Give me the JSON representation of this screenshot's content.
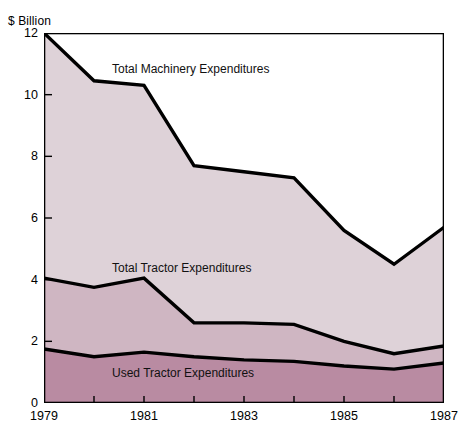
{
  "chart_data": {
    "type": "area",
    "title": "",
    "subtitle": "",
    "xlabel": "",
    "ylabel": "$ Billion",
    "unit_label": "$ Billion",
    "x": [
      1979,
      1980,
      1981,
      1982,
      1983,
      1984,
      1985,
      1986,
      1987
    ],
    "xtick_labels": [
      "1979",
      "1981",
      "1983",
      "1985",
      "1987"
    ],
    "xtick_values": [
      1979,
      1981,
      1983,
      1985,
      1987
    ],
    "xlim": [
      1979,
      1987
    ],
    "ytick_labels": [
      "0",
      "2",
      "4",
      "6",
      "8",
      "10",
      "12"
    ],
    "ytick_values": [
      0,
      2,
      4,
      6,
      8,
      10,
      12
    ],
    "ylim": [
      0,
      12
    ],
    "grid": false,
    "legend_position": "inline-annotations",
    "stacked": false,
    "series": [
      {
        "name": "Total Machinery Expenditures",
        "label": "Total Machinery Expenditures",
        "fill_color": "#ded2d8",
        "line_color": "#000000",
        "values": [
          12.0,
          10.45,
          10.3,
          7.7,
          7.5,
          7.3,
          5.6,
          4.5,
          5.7
        ]
      },
      {
        "name": "Total Tractor Expenditures",
        "label": "Total Tractor Expenditures",
        "fill_color": "#cfb6c2",
        "line_color": "#000000",
        "values": [
          4.05,
          3.75,
          4.05,
          2.6,
          2.6,
          2.55,
          2.0,
          1.6,
          1.85
        ]
      },
      {
        "name": "Used Tractor Expenditures",
        "label": "Used Tractor Expenditures",
        "fill_color": "#b98ba2",
        "line_color": "#000000",
        "values": [
          1.75,
          1.5,
          1.65,
          1.5,
          1.4,
          1.35,
          1.2,
          1.1,
          1.3
        ]
      }
    ],
    "annotations": [
      {
        "text": "Total Machinery Expenditures",
        "x_px": 112,
        "y_px": 62
      },
      {
        "text": "Total Tractor Expenditures",
        "x_px": 112,
        "y_px": 261
      },
      {
        "text": "Used Tractor Expenditures",
        "x_px": 112,
        "y_px": 366
      }
    ]
  },
  "axes": {
    "y_unit": "$ Billion",
    "y_ticks": [
      "12",
      "10",
      "8",
      "6",
      "4",
      "2",
      "0"
    ],
    "x_ticks": [
      "1979",
      "1981",
      "1983",
      "1985",
      "1987"
    ]
  }
}
